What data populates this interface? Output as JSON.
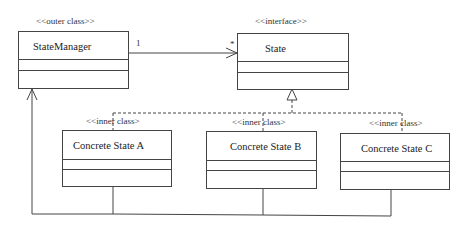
{
  "diagram": {
    "type": "UML class diagram",
    "pattern": "State",
    "classes": [
      {
        "id": "state-manager",
        "stereotype": "<<outer class>>",
        "name": "StateManager"
      },
      {
        "id": "state",
        "stereotype": "<<interface>>",
        "name": "State"
      },
      {
        "id": "concrete-a",
        "stereotype": "<<inner class>",
        "name": "Concrete State A"
      },
      {
        "id": "concrete-b",
        "stereotype": "<<inner class>",
        "name": "Concrete State B"
      },
      {
        "id": "concrete-c",
        "stereotype": "<<inner class>",
        "name": "Concrete State C"
      }
    ],
    "associations": [
      {
        "from": "state-manager",
        "to": "state",
        "from_multiplicity": "1",
        "to_multiplicity": "*",
        "kind": "directed-association"
      }
    ],
    "realizations": [
      {
        "from": "concrete-a",
        "to": "state"
      },
      {
        "from": "concrete-b",
        "to": "state"
      },
      {
        "from": "concrete-c",
        "to": "state"
      }
    ],
    "containment": {
      "parent": "state-manager",
      "children": [
        "concrete-a",
        "concrete-b",
        "concrete-c"
      ]
    }
  },
  "colors": {
    "line": "#444444",
    "text": "#222222",
    "background": "#ffffff"
  }
}
